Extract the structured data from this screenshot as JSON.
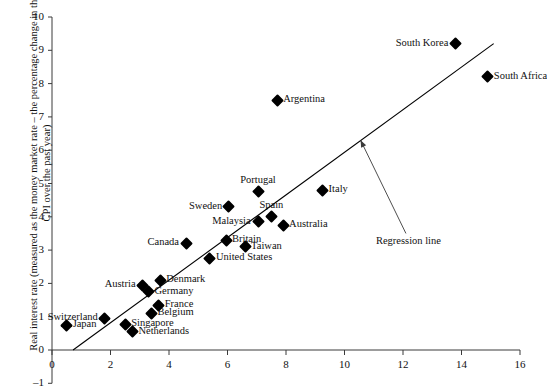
{
  "chart_data": {
    "type": "scatter",
    "title": "",
    "xlabel": "Nominal interest rate (money market rate, %)",
    "ylabel": "Real interest rate (measured as the money market rate – the percentage change in the CPI over the past year)",
    "xlim": [
      0,
      16
    ],
    "ylim": [
      -1,
      10
    ],
    "xticks": [
      "0",
      "2",
      "4",
      "6",
      "8",
      "10",
      "12",
      "14",
      "16"
    ],
    "yticks": [
      "-1",
      "0",
      "1",
      "2",
      "3",
      "4",
      "5",
      "6",
      "7",
      "8",
      "9",
      "10"
    ],
    "grid": false,
    "legend": "none",
    "points": [
      {
        "name": "Japan",
        "x": 0.5,
        "y": 0.75,
        "label_side": "right"
      },
      {
        "name": "Switzerland",
        "x": 1.8,
        "y": 0.95,
        "label_side": "left"
      },
      {
        "name": "Singapore",
        "x": 2.5,
        "y": 0.78,
        "label_side": "right"
      },
      {
        "name": "Belgium",
        "x": 3.4,
        "y": 1.1,
        "label_side": "right"
      },
      {
        "name": "Netherlands",
        "x": 2.75,
        "y": 0.55,
        "label_side": "right"
      },
      {
        "name": "France",
        "x": 3.65,
        "y": 1.35,
        "label_side": "right"
      },
      {
        "name": "Germany",
        "x": 3.3,
        "y": 1.75,
        "label_side": "right"
      },
      {
        "name": "Austria",
        "x": 3.1,
        "y": 1.95,
        "label_side": "left"
      },
      {
        "name": "Denmark",
        "x": 3.7,
        "y": 2.1,
        "label_side": "right"
      },
      {
        "name": "Canada",
        "x": 4.6,
        "y": 3.2,
        "label_side": "left"
      },
      {
        "name": "United States",
        "x": 5.4,
        "y": 2.75,
        "label_side": "right"
      },
      {
        "name": "Britain",
        "x": 5.95,
        "y": 3.3,
        "label_side": "right"
      },
      {
        "name": "Sweden",
        "x": 6.05,
        "y": 4.3,
        "label_side": "left"
      },
      {
        "name": "Taiwan",
        "x": 6.6,
        "y": 3.1,
        "label_side": "right"
      },
      {
        "name": "Malaysia",
        "x": 7.05,
        "y": 3.85,
        "label_side": "left"
      },
      {
        "name": "Portugal",
        "x": 7.05,
        "y": 4.75,
        "label_side": "top"
      },
      {
        "name": "Spain",
        "x": 7.5,
        "y": 4.0,
        "label_side": "top"
      },
      {
        "name": "Australia",
        "x": 7.9,
        "y": 3.75,
        "label_side": "right"
      },
      {
        "name": "Argentina",
        "x": 7.7,
        "y": 7.5,
        "label_side": "right"
      },
      {
        "name": "Italy",
        "x": 9.25,
        "y": 4.8,
        "label_side": "right"
      },
      {
        "name": "South Korea",
        "x": 13.8,
        "y": 9.2,
        "label_side": "left"
      },
      {
        "name": "South Africa",
        "x": 14.9,
        "y": 8.2,
        "label_side": "right"
      }
    ],
    "regression_line": {
      "label": "Regression line",
      "x_start": 0.72,
      "y_start": 0.0,
      "x_end": 15.1,
      "y_end": 9.2
    },
    "annotation_arrow": {
      "from_x": 12.1,
      "from_y": 3.5,
      "to_x": 10.55,
      "to_y": 6.3
    }
  }
}
